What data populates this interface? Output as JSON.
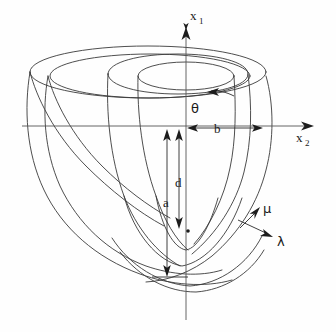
{
  "figure": {
    "background_color": "#fefefe",
    "line_color": "#3a3a3a",
    "axes": {
      "vertical": {
        "name": "x1",
        "label_base": "x",
        "label_sub": "1",
        "arrow_direction": "up"
      },
      "horizontal": {
        "name": "x2",
        "label_base": "x",
        "label_sub": "2",
        "arrow_direction": "right"
      }
    },
    "dimensions": [
      {
        "id": "a",
        "label": "a",
        "orientation": "vertical",
        "description": "distance from equatorial plane to apex"
      },
      {
        "id": "d",
        "label": "d",
        "orientation": "vertical",
        "description": "distance from equatorial plane to focus"
      },
      {
        "id": "b",
        "label": "b",
        "orientation": "horizontal",
        "description": "equatorial semi-axis"
      }
    ],
    "coordinate_labels": [
      {
        "id": "theta",
        "label": "θ",
        "description": "azimuthal angle, curved arrow at the rim"
      },
      {
        "id": "mu",
        "label": "μ",
        "description": "angular coordinate, arrow tangent to surface"
      },
      {
        "id": "lambda",
        "label": "λ",
        "description": "radial coordinate, arrow outward from surface"
      }
    ],
    "markers": [
      {
        "id": "focus-point",
        "label": "",
        "description": "focus of the prolate spheroid, filled dot on the axis"
      }
    ]
  }
}
